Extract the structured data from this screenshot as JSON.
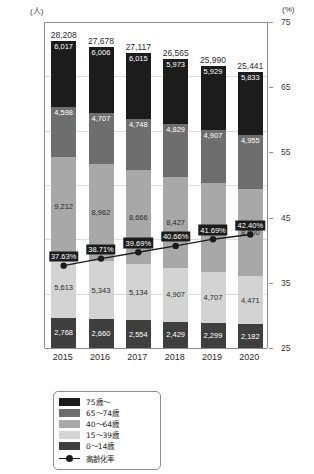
{
  "axes": {
    "left_unit": "(人)",
    "right_unit": "(%)",
    "left_ticks": [
      "30,000",
      "25,000",
      "20,000",
      "15,000",
      "10,000",
      "5,000",
      "0"
    ],
    "right_ticks": [
      "75",
      "65",
      "55",
      "45",
      "35",
      "25"
    ]
  },
  "legend": {
    "items": [
      {
        "label": "75歳～",
        "color": "#1c1c1c"
      },
      {
        "label": "65～74歳",
        "color": "#6e6e6e"
      },
      {
        "label": "40～64歳",
        "color": "#a8a8a8"
      },
      {
        "label": "15～39歳",
        "color": "#d3d3d3"
      },
      {
        "label": "0～14歳",
        "color": "#3f3f3f"
      }
    ],
    "line_label": "高齢化率",
    "line_color": "#1c1c1c"
  },
  "chart_data": {
    "type": "bar",
    "title": "",
    "xlabel": "",
    "ylabel": "(人)",
    "y2label": "(%)",
    "ylim": [
      0,
      30000
    ],
    "y2lim": [
      25,
      75
    ],
    "grid": true,
    "legend_position": "bottom-left",
    "stacked": true,
    "categories": [
      "2015",
      "2016",
      "2017",
      "2018",
      "2019",
      "2020"
    ],
    "series": [
      {
        "name": "0～14歳",
        "color": "#3f3f3f",
        "values": [
          2768,
          2660,
          2554,
          2429,
          2299,
          2182
        ],
        "labels": [
          "2,768",
          "2,660",
          "2,554",
          "2,429",
          "2,299",
          "2,182"
        ]
      },
      {
        "name": "15～39歳",
        "color": "#d3d3d3",
        "values": [
          5613,
          5343,
          5134,
          4907,
          4707,
          4471
        ],
        "labels": [
          "5,613",
          "5,343",
          "5,134",
          "4,907",
          "4,707",
          "4,471"
        ]
      },
      {
        "name": "40～64歳",
        "color": "#a8a8a8",
        "values": [
          9212,
          8962,
          8666,
          8427,
          8148,
          8000
        ],
        "labels": [
          "9,212",
          "8,962",
          "8,666",
          "8,427",
          "8,148",
          "8,000"
        ]
      },
      {
        "name": "65～74歳",
        "color": "#6e6e6e",
        "values": [
          4598,
          4707,
          4748,
          4829,
          4907,
          4955
        ],
        "labels": [
          "4,598",
          "4,707",
          "4,748",
          "4,829",
          "4,907",
          "4,955"
        ]
      },
      {
        "name": "75歳～",
        "color": "#1c1c1c",
        "values": [
          6017,
          6006,
          6015,
          5973,
          5929,
          5833
        ],
        "labels": [
          "6,017",
          "6,006",
          "6,015",
          "5,973",
          "5,929",
          "5,833"
        ]
      }
    ],
    "totals": [
      28208,
      27678,
      27117,
      26565,
      25990,
      25441
    ],
    "total_labels": [
      "28,208",
      "27,678",
      "27,117",
      "26,565",
      "25,990",
      "25,441"
    ],
    "line_series": {
      "name": "高齢化率",
      "axis": "right",
      "color": "#1c1c1c",
      "values": [
        37.63,
        38.71,
        39.69,
        40.66,
        41.69,
        42.4
      ],
      "labels": [
        "37.63%",
        "38.71%",
        "39.69%",
        "40.66%",
        "41.69%",
        "42.40%"
      ]
    }
  }
}
